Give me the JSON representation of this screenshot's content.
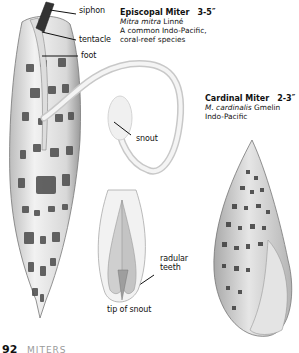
{
  "page": {
    "number": "92",
    "section": "MITERS"
  },
  "species": [
    {
      "common_name": "Episcopal Miter",
      "size": "3-5″",
      "scientific_name": "Mitra mitra",
      "author": "Linné",
      "notes": [
        "A common Indo-Pacific,",
        "coral-reef species"
      ]
    },
    {
      "common_name": "Cardinal Miter",
      "size": "2-3″",
      "scientific_name": "M. cardinalis",
      "author": "Gmelin",
      "notes": [
        "Indo-Pacific"
      ]
    }
  ],
  "anatomy_labels": {
    "siphon": "siphon",
    "tentacle": "tentacle",
    "foot": "foot",
    "snout": "snout",
    "radular_teeth_line1": "radular",
    "radular_teeth_line2": "teeth",
    "tip_of_snout": "tip of snout"
  }
}
